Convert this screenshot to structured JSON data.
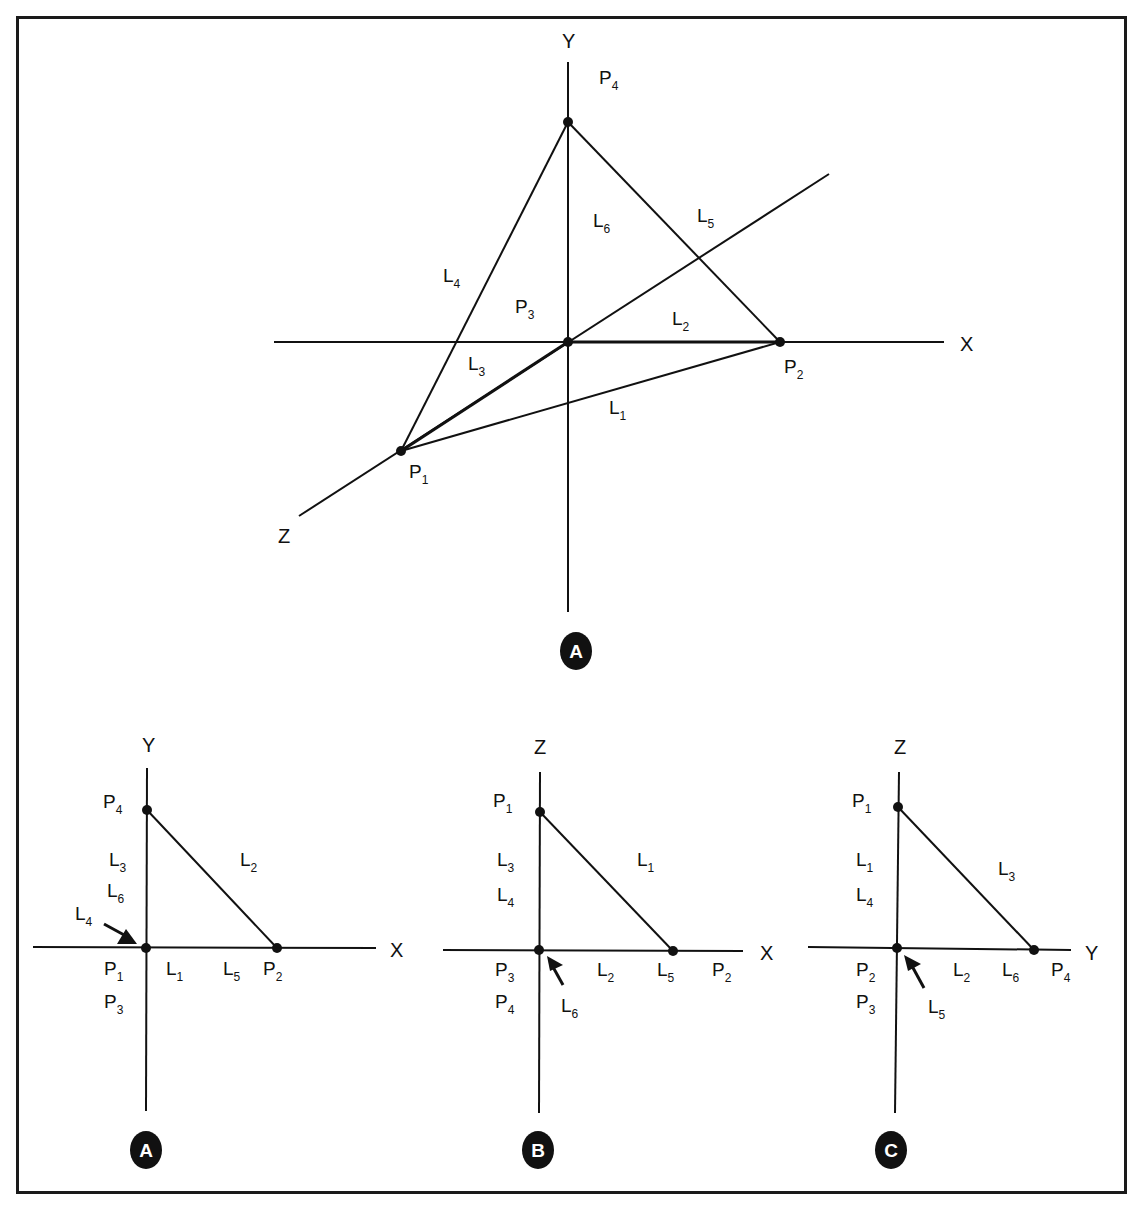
{
  "colors": {
    "ink": "#111111",
    "background": "#ffffff",
    "badge_fill": "#111111",
    "badge_text": "#ffffff"
  },
  "top_diagram": {
    "badge": "A",
    "axes": {
      "x": "X",
      "y": "Y",
      "z": "Z"
    },
    "points": {
      "P1": {
        "label": "P",
        "sub": "1"
      },
      "P2": {
        "label": "P",
        "sub": "2"
      },
      "P3": {
        "label": "P",
        "sub": "3"
      },
      "P4": {
        "label": "P",
        "sub": "4"
      }
    },
    "lines": {
      "L1": {
        "label": "L",
        "sub": "1"
      },
      "L2": {
        "label": "L",
        "sub": "2"
      },
      "L3": {
        "label": "L",
        "sub": "3"
      },
      "L4": {
        "label": "L",
        "sub": "4"
      },
      "L5": {
        "label": "L",
        "sub": "5"
      },
      "L6": {
        "label": "L",
        "sub": "6"
      }
    }
  },
  "bottom_diagrams": [
    {
      "badge": "A",
      "axes": {
        "vertical": "Y",
        "horizontal": "X"
      },
      "top_point": {
        "label": "P",
        "sub": "4"
      },
      "vertical_lines": [
        {
          "label": "L",
          "sub": "3"
        },
        {
          "label": "L",
          "sub": "6"
        }
      ],
      "arrow_line": {
        "label": "L",
        "sub": "4"
      },
      "hypotenuse": {
        "label": "L",
        "sub": "2"
      },
      "origin_points": [
        {
          "label": "P",
          "sub": "1"
        },
        {
          "label": "P",
          "sub": "3"
        }
      ],
      "horizontal_lines": [
        {
          "label": "L",
          "sub": "1"
        },
        {
          "label": "L",
          "sub": "5"
        }
      ],
      "end_point": {
        "label": "P",
        "sub": "2"
      }
    },
    {
      "badge": "B",
      "axes": {
        "vertical": "Z",
        "horizontal": "X"
      },
      "top_point": {
        "label": "P",
        "sub": "1"
      },
      "vertical_lines": [
        {
          "label": "L",
          "sub": "3"
        },
        {
          "label": "L",
          "sub": "4"
        }
      ],
      "arrow_line": {
        "label": "L",
        "sub": "6"
      },
      "hypotenuse": {
        "label": "L",
        "sub": "1"
      },
      "origin_points": [
        {
          "label": "P",
          "sub": "3"
        },
        {
          "label": "P",
          "sub": "4"
        }
      ],
      "horizontal_lines": [
        {
          "label": "L",
          "sub": "2"
        },
        {
          "label": "L",
          "sub": "5"
        }
      ],
      "end_point": {
        "label": "P",
        "sub": "2"
      }
    },
    {
      "badge": "C",
      "axes": {
        "vertical": "Z",
        "horizontal": "Y"
      },
      "top_point": {
        "label": "P",
        "sub": "1"
      },
      "vertical_lines": [
        {
          "label": "L",
          "sub": "1"
        },
        {
          "label": "L",
          "sub": "4"
        }
      ],
      "arrow_line": {
        "label": "L",
        "sub": "5"
      },
      "hypotenuse": {
        "label": "L",
        "sub": "3"
      },
      "origin_points": [
        {
          "label": "P",
          "sub": "2"
        },
        {
          "label": "P",
          "sub": "3"
        }
      ],
      "horizontal_lines": [
        {
          "label": "L",
          "sub": "2"
        },
        {
          "label": "L",
          "sub": "6"
        }
      ],
      "end_point": {
        "label": "P",
        "sub": "4"
      }
    }
  ]
}
